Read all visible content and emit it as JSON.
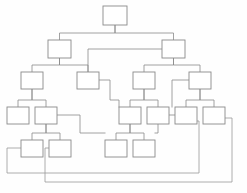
{
  "diagram": {
    "type": "tree-flowchart",
    "canvas": {
      "width": 247,
      "height": 193
    },
    "style": {
      "background_color": "#fefefe",
      "node_fill": "#ffffff",
      "node_stroke": "#8a8a8a",
      "link_stroke": "#8a8a8a",
      "feedback_stroke": "#9a9a9a",
      "node_stroke_width": 0.9,
      "link_stroke_width": 0.8
    },
    "node_size": {
      "width": 22,
      "height": 16
    },
    "levels": [
      {
        "index": 0,
        "y": 6,
        "node_count": 1
      },
      {
        "index": 1,
        "y": 40,
        "node_count": 2
      },
      {
        "index": 2,
        "y": 72,
        "node_count": 4
      },
      {
        "index": 3,
        "y": 107,
        "node_count": 6
      },
      {
        "index": 4,
        "y": 140,
        "node_count": 4
      }
    ],
    "nodes": [
      {
        "id": "n0",
        "label": "",
        "level": 0,
        "x": 103,
        "y": 6,
        "w": 24,
        "h": 19
      },
      {
        "id": "n1",
        "label": "",
        "level": 1,
        "x": 48,
        "y": 40,
        "w": 23,
        "h": 18
      },
      {
        "id": "n2",
        "label": "",
        "level": 1,
        "x": 162,
        "y": 40,
        "w": 23,
        "h": 18
      },
      {
        "id": "n3",
        "label": "",
        "level": 2,
        "x": 21,
        "y": 72,
        "w": 22,
        "h": 17
      },
      {
        "id": "n4",
        "label": "",
        "level": 2,
        "x": 77,
        "y": 72,
        "w": 22,
        "h": 17
      },
      {
        "id": "n5",
        "label": "",
        "level": 2,
        "x": 133,
        "y": 72,
        "w": 22,
        "h": 17
      },
      {
        "id": "n6",
        "label": "",
        "level": 2,
        "x": 189,
        "y": 72,
        "w": 22,
        "h": 17
      },
      {
        "id": "n7",
        "label": "",
        "level": 3,
        "x": 7,
        "y": 107,
        "w": 22,
        "h": 17
      },
      {
        "id": "n8",
        "label": "",
        "level": 3,
        "x": 35,
        "y": 107,
        "w": 22,
        "h": 17
      },
      {
        "id": "n9",
        "label": "",
        "level": 3,
        "x": 119,
        "y": 107,
        "w": 22,
        "h": 17
      },
      {
        "id": "n10",
        "label": "",
        "level": 3,
        "x": 147,
        "y": 107,
        "w": 22,
        "h": 17
      },
      {
        "id": "n11",
        "label": "",
        "level": 3,
        "x": 175,
        "y": 107,
        "w": 22,
        "h": 17
      },
      {
        "id": "n12",
        "label": "",
        "level": 3,
        "x": 203,
        "y": 107,
        "w": 22,
        "h": 17
      },
      {
        "id": "n13",
        "label": "",
        "level": 4,
        "x": 21,
        "y": 140,
        "w": 22,
        "h": 17
      },
      {
        "id": "n14",
        "label": "",
        "level": 4,
        "x": 49,
        "y": 140,
        "w": 22,
        "h": 17
      },
      {
        "id": "n15",
        "label": "",
        "level": 4,
        "x": 105,
        "y": 140,
        "w": 22,
        "h": 17
      },
      {
        "id": "n16",
        "label": "",
        "level": 4,
        "x": 133,
        "y": 140,
        "w": 22,
        "h": 17
      }
    ],
    "tree_links": [
      {
        "from": "n0",
        "to": "n1",
        "path": "M115,25 L115,33 L59.5,33 L59.5,40"
      },
      {
        "from": "n0",
        "to": "n2",
        "path": "M115,25 L115,33 L173.5,33 L173.5,40"
      },
      {
        "from": "n1",
        "to": "n3",
        "path": "M59.5,58 L59.5,65 L32,65 L32,72"
      },
      {
        "from": "n1",
        "to": "n4",
        "path": "M59.5,58 L59.5,65 L88,65 L88,72"
      },
      {
        "from": "n2",
        "to": "n5",
        "path": "M173.5,58 L173.5,65 L144,65 L144,72"
      },
      {
        "from": "n2",
        "to": "n6",
        "path": "M173.5,58 L173.5,65 L200,65 L200,72"
      },
      {
        "from": "n3",
        "to": "n7",
        "path": "M32,89 L32,100 L18,100 L18,107"
      },
      {
        "from": "n3",
        "to": "n8",
        "path": "M32,89 L32,100 L46,100 L46,107"
      },
      {
        "from": "n5",
        "to": "n9",
        "path": "M144,89 L144,100 L130,100 L130,107"
      },
      {
        "from": "n5",
        "to": "n10",
        "path": "M144,89 L144,100 L158,100 L158,107"
      },
      {
        "from": "n6",
        "to": "n11",
        "path": "M200,89 L200,100 L186,100 L186,107"
      },
      {
        "from": "n6",
        "to": "n12",
        "path": "M200,89 L200,100 L214,100 L214,107"
      },
      {
        "from": "n8",
        "to": "n13",
        "path": "M46,124 L46,133 L32,133 L32,140"
      },
      {
        "from": "n8",
        "to": "n14",
        "path": "M46,124 L46,133 L60,133 L60,140"
      },
      {
        "from": "n9",
        "to": "n15",
        "path": "M130,124 L130,133 L116,133 L116,140"
      },
      {
        "from": "n9",
        "to": "n16",
        "path": "M130,124 L130,133 L144,133 L144,140"
      }
    ],
    "cross_links": [
      {
        "from": "n2",
        "to": "n4",
        "path": "M162,49 L88,49 L88,72"
      },
      {
        "from": "n4",
        "to": "n9",
        "path": "M99,80 L110,80 L110,100 L119,100 L119,107"
      },
      {
        "from": "n6",
        "to": "n11",
        "path": "M189,80 L172,80 L172,107"
      },
      {
        "from": "n8",
        "to": "n15",
        "path": "M57,115 L80,115 L80,133 L105,133"
      },
      {
        "from": "n11",
        "to": "n16",
        "path": "M175,115 L158,115 L158,133 L155,133"
      }
    ],
    "feedback_loops": [
      {
        "id": "fb1",
        "from": "n11",
        "to": "n13",
        "path": "M197,121 L199,121 L199,173 L7,173 L7,148 L21,148"
      },
      {
        "id": "fb2",
        "from": "n12",
        "to": "n14",
        "path": "M225,118 L232,118 L232,182 L45,182 L45,148 L49,148"
      }
    ]
  }
}
